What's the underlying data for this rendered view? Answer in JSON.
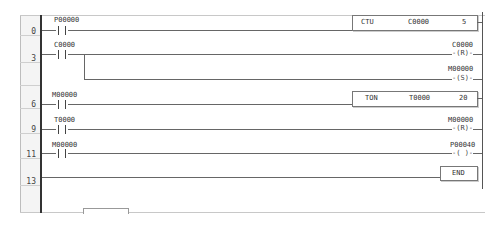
{
  "ladder": {
    "row_numbers": [
      "0",
      "3",
      "6",
      "9",
      "11",
      "13"
    ],
    "rungs": [
      {
        "step": "0",
        "contact": "P00000",
        "instruction": {
          "op": "CTU",
          "operand": "C0000",
          "value": "5"
        }
      },
      {
        "step": "3",
        "contact": "C0000",
        "coils": [
          {
            "address": "C0000",
            "type": "-(R)-"
          },
          {
            "address": "M00000",
            "type": "-(S)-"
          }
        ]
      },
      {
        "step": "6",
        "contact": "M00000",
        "instruction": {
          "op": "TON",
          "operand": "T0000",
          "value": "20"
        }
      },
      {
        "step": "9",
        "contact": "T0000",
        "coil": {
          "address": "M00000",
          "type": "-(R)-"
        }
      },
      {
        "step": "11",
        "contact": "M00000",
        "coil": {
          "address": "P00040",
          "type": "-( )-"
        }
      },
      {
        "step": "13",
        "instruction": {
          "op": "END"
        }
      }
    ]
  }
}
